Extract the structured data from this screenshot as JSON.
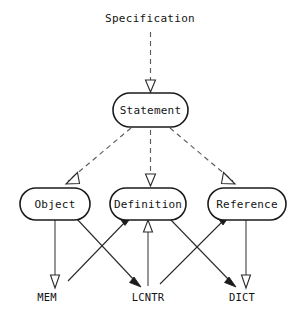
{
  "diagram": {
    "title": "Specification",
    "title_position": {
      "x": 150,
      "y": 22
    },
    "canvas": {
      "width": 299,
      "height": 318,
      "background": "#ffffff"
    },
    "colors": {
      "node_stroke": "#1b1b1b",
      "node_fill": "#ffffff",
      "text": "#141414",
      "dashed_edge": "#5d5d5d",
      "solid_edge": "#4a4a4a",
      "arrow_open_fill": "#ffffff",
      "arrow_filled": "#1b1b1b"
    },
    "nodes": [
      {
        "id": "statement",
        "label": "Statement",
        "shape": "stadium",
        "x": 113,
        "y": 93,
        "width": 75,
        "height": 34,
        "rx": 17,
        "cx": 150.5,
        "cy": 110
      },
      {
        "id": "object",
        "label": "Object",
        "shape": "stadium",
        "x": 20,
        "y": 188,
        "width": 70,
        "height": 32,
        "rx": 16,
        "cx": 55,
        "cy": 204
      },
      {
        "id": "definition",
        "label": "Definition",
        "shape": "stadium",
        "x": 110,
        "y": 188,
        "width": 76,
        "height": 32,
        "rx": 16,
        "cx": 148,
        "cy": 204
      },
      {
        "id": "reference",
        "label": "Reference",
        "shape": "stadium",
        "x": 208,
        "y": 188,
        "width": 78,
        "height": 32,
        "rx": 16,
        "cx": 247,
        "cy": 204
      }
    ],
    "stores": [
      {
        "id": "mem",
        "label": "MEM",
        "x": 47,
        "y": 301
      },
      {
        "id": "lcntr",
        "label": "LCNTR",
        "x": 148,
        "y": 301
      },
      {
        "id": "dict",
        "label": "DICT",
        "x": 242,
        "y": 301
      }
    ],
    "edges": [
      {
        "id": "spec-to-statement",
        "from": "Specification",
        "to": "Statement",
        "style": "dashed",
        "arrowhead": "open",
        "x1": 150.5,
        "y1": 32,
        "x2": 150.5,
        "y2": 92
      },
      {
        "id": "statement-to-object",
        "from": "Statement",
        "to": "Object",
        "style": "dashed",
        "arrowhead": "open",
        "x1": 128,
        "y1": 127,
        "x2": 62,
        "y2": 186
      },
      {
        "id": "statement-to-definition",
        "from": "Statement",
        "to": "Definition",
        "style": "dashed",
        "arrowhead": "open",
        "x1": 150.5,
        "y1": 128,
        "x2": 150.5,
        "y2": 186
      },
      {
        "id": "statement-to-reference",
        "from": "Statement",
        "to": "Reference",
        "style": "dashed",
        "arrowhead": "open",
        "x1": 173,
        "y1": 127,
        "x2": 238,
        "y2": 186
      },
      {
        "id": "object-to-mem",
        "from": "Object",
        "to": "MEM",
        "style": "solid",
        "arrowhead": "open",
        "x1": 55,
        "y1": 220,
        "x2": 55,
        "y2": 288
      },
      {
        "id": "object-to-lcntr",
        "from": "Object",
        "to": "LCNTR",
        "style": "solid",
        "arrowhead": "filled",
        "x1": 78,
        "y1": 219,
        "x2": 137,
        "y2": 286
      },
      {
        "id": "mem-to-definition",
        "from": "MEM",
        "to": "Definition",
        "style": "solid",
        "arrowhead": "filled",
        "x1": 66,
        "y1": 286,
        "x2": 127,
        "y2": 220
      },
      {
        "id": "lcntr-to-definition",
        "from": "LCNTR",
        "to": "Definition",
        "style": "solid",
        "arrowhead": "open",
        "x1": 148,
        "y1": 286,
        "x2": 148,
        "y2": 221
      },
      {
        "id": "definition-to-dict",
        "from": "Definition",
        "to": "DICT",
        "style": "solid",
        "arrowhead": "filled",
        "x1": 170,
        "y1": 220,
        "x2": 231,
        "y2": 286
      },
      {
        "id": "lcntr-to-reference",
        "from": "LCNTR",
        "to": "Reference",
        "style": "solid",
        "arrowhead": "filled",
        "x1": 159,
        "y1": 286,
        "x2": 225,
        "y2": 220
      },
      {
        "id": "reference-to-dict",
        "from": "Reference",
        "to": "DICT",
        "style": "solid",
        "arrowhead": "open",
        "x1": 246,
        "y1": 220,
        "x2": 246,
        "y2": 288
      }
    ]
  }
}
